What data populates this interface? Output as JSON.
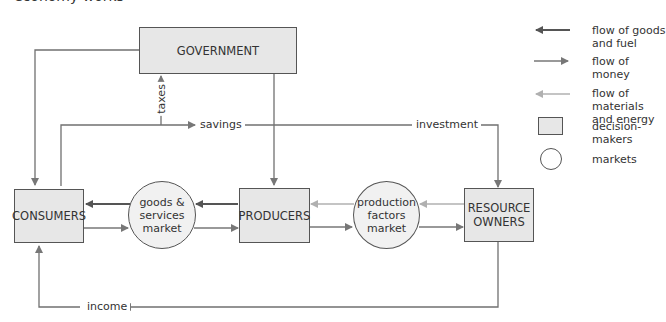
{
  "header": {
    "title": "economy works"
  },
  "nodes": {
    "government": "GOVERNMENT",
    "consumers": "CONSUMERS",
    "producers": "PRODUCERS",
    "resource_owners": [
      "RESOURCE",
      "OWNERS"
    ],
    "goods_market": [
      "goods &",
      "services",
      "market"
    ],
    "factors_market": [
      "production",
      "factors",
      "market"
    ]
  },
  "flow_labels": {
    "taxes": "taxes",
    "savings": "savings",
    "investment": "investment",
    "income": "income"
  },
  "legend": {
    "goods_fuel": [
      "flow of goods",
      "and fuel"
    ],
    "money": "flow of money",
    "materials_energy": [
      "flow of materials",
      "and energy"
    ],
    "decision_makers": "decision-makers",
    "markets": "markets"
  },
  "colors": {
    "line": "#707070",
    "goods_arrow": "#555555",
    "money_arrow": "#777777",
    "materials_arrow": "#b0b0b0",
    "box_fill": "#e7e7e7",
    "border": "#555555"
  }
}
